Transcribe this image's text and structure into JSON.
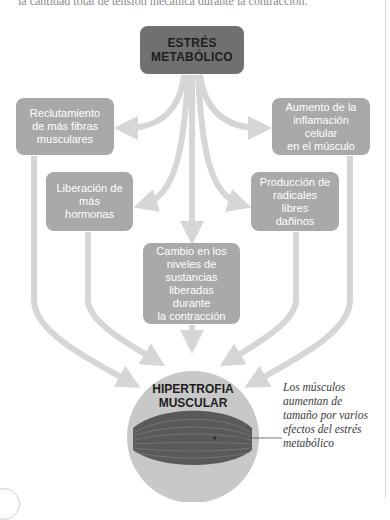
{
  "header": {
    "cut_text": "la cantidad total de tensión mecánica durante la contracción."
  },
  "diagram": {
    "title": "ESTRÉS METABÓLICO",
    "title_lines": [
      "ESTRÉS",
      "METABÓLICO"
    ],
    "effects": [
      {
        "id": "reclutamiento",
        "lines": [
          "Reclutamiento",
          "de más fibras",
          "musculares"
        ]
      },
      {
        "id": "inflamacion",
        "lines": [
          "Aumento de la",
          "inflamación celular",
          "en el músculo"
        ]
      },
      {
        "id": "hormonas",
        "lines": [
          "Liberación de",
          "más hormonas"
        ]
      },
      {
        "id": "radicales",
        "lines": [
          "Producción de",
          "radicales libres",
          "dañinos"
        ]
      },
      {
        "id": "sustancias",
        "lines": [
          "Cambio en los",
          "niveles de",
          "sustancias",
          "liberadas durante",
          "la contracción"
        ]
      }
    ],
    "result": {
      "title": "HIPERTROFIA MUSCULAR",
      "lines": [
        "HIPERTROFIA",
        "MUSCULAR"
      ]
    },
    "caption_lines": [
      "Los músculos",
      "aumentan de",
      "tamaño por varios",
      "efectos del estrés",
      "metabólico"
    ]
  },
  "colors": {
    "title_box": "#707070",
    "effect_box": "#a9a9a9",
    "arrow": "#d6d6d6",
    "circle": "#c8c8c8",
    "muscle": "#5a5a5a"
  }
}
